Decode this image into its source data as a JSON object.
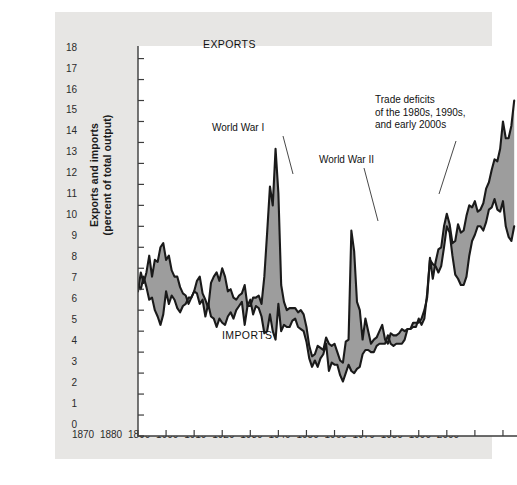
{
  "figure": {
    "background_color": "#e7e6e4",
    "plot_background_color": "#ffffff",
    "band_fill_color": "#9d9d9d",
    "line_color": "#1a1a1a"
  },
  "axis": {
    "y_title_line1": "Exports and imports",
    "y_title_line2": "(percent of total output)",
    "x_title": "Year",
    "y_ticks": [
      "0",
      "1",
      "2",
      "3",
      "4",
      "5",
      "6",
      "7",
      "8",
      "9",
      "10",
      "11",
      "12",
      "13",
      "14",
      "15",
      "16",
      "17",
      "18"
    ],
    "x_ticks": [
      "1870",
      "1880",
      "1890",
      "1900",
      "1910",
      "1920",
      "1930",
      "1940",
      "1950",
      "1960",
      "1970",
      "1980",
      "1990",
      "2000"
    ]
  },
  "labels": {
    "exports": "EXPORTS",
    "imports": "IMPORTS",
    "world_war_1": "World War I",
    "world_war_2": "World War II",
    "trade_deficits": "Trade deficits\nof the 1980s, 1990s,\nand early 2000s"
  },
  "chart_data": {
    "type": "area",
    "title": "",
    "subtitle": "",
    "xlabel": "Year",
    "ylabel": "Exports and imports (percent of total output)",
    "xlim": [
      1870,
      2005
    ],
    "ylim": [
      0,
      18.6
    ],
    "grid": false,
    "legend": "inline-labels",
    "annotations": [
      {
        "text": "World War I",
        "x": 1913,
        "y": 13.2
      },
      {
        "text": "World War II",
        "x": 1946,
        "y": 11.6
      },
      {
        "text": "Trade deficits of the 1980s, 1990s, and early 2000s",
        "x": 1977,
        "y": 15.2
      },
      {
        "text": "EXPORTS",
        "x": 1903,
        "y": 9.3
      },
      {
        "text": "IMPORTS",
        "x": 1906,
        "y": 4.8
      }
    ],
    "x": [
      1870,
      1871,
      1872,
      1873,
      1874,
      1875,
      1876,
      1877,
      1878,
      1879,
      1880,
      1881,
      1882,
      1883,
      1884,
      1885,
      1886,
      1887,
      1888,
      1889,
      1890,
      1891,
      1892,
      1893,
      1894,
      1895,
      1896,
      1897,
      1898,
      1899,
      1900,
      1901,
      1902,
      1903,
      1904,
      1905,
      1906,
      1907,
      1908,
      1909,
      1910,
      1911,
      1912,
      1913,
      1914,
      1915,
      1916,
      1917,
      1918,
      1919,
      1920,
      1921,
      1922,
      1923,
      1924,
      1925,
      1926,
      1927,
      1928,
      1929,
      1930,
      1931,
      1932,
      1933,
      1934,
      1935,
      1936,
      1937,
      1938,
      1939,
      1940,
      1941,
      1942,
      1943,
      1944,
      1945,
      1946,
      1947,
      1948,
      1949,
      1950,
      1951,
      1952,
      1953,
      1954,
      1955,
      1956,
      1957,
      1958,
      1959,
      1960,
      1961,
      1962,
      1963,
      1964,
      1965,
      1966,
      1967,
      1968,
      1969,
      1970,
      1971,
      1972,
      1973,
      1974,
      1975,
      1976,
      1977,
      1978,
      1979,
      1980,
      1981,
      1982,
      1983,
      1984,
      1985,
      1986,
      1987,
      1988,
      1989,
      1990,
      1991,
      1992,
      1993,
      1994,
      1995,
      1996,
      1997,
      1998,
      1999,
      2000,
      2001,
      2002,
      2003,
      2004
    ],
    "series": [
      {
        "name": "EXPORTS",
        "values": [
          6.9,
          7.8,
          7.3,
          7.8,
          8.6,
          7.6,
          8.4,
          8.3,
          9.0,
          9.2,
          8.4,
          8.6,
          7.9,
          7.6,
          7.6,
          7.1,
          6.8,
          6.7,
          6.3,
          6.6,
          6.9,
          7.4,
          7.6,
          6.8,
          6.5,
          6.1,
          7.3,
          7.6,
          7.8,
          7.4,
          8.0,
          7.6,
          6.9,
          7.0,
          6.6,
          6.5,
          6.7,
          6.8,
          7.2,
          6.2,
          6.2,
          6.6,
          6.6,
          6.7,
          6.3,
          7.6,
          9.7,
          11.9,
          11.0,
          13.7,
          11.6,
          7.2,
          6.4,
          6.0,
          6.1,
          6.1,
          6.1,
          5.9,
          6.0,
          5.8,
          5.2,
          4.3,
          3.8,
          3.9,
          4.3,
          4.2,
          4.1,
          4.7,
          4.4,
          4.3,
          4.4,
          4.0,
          3.6,
          3.5,
          4.5,
          4.6,
          9.8,
          8.8,
          6.4,
          6.0,
          4.6,
          5.6,
          5.0,
          4.4,
          4.6,
          4.7,
          5.0,
          5.3,
          4.6,
          4.4,
          4.9,
          4.8,
          4.8,
          4.9,
          5.1,
          5.0,
          5.1,
          5.1,
          5.2,
          5.2,
          5.6,
          5.3,
          5.6,
          6.8,
          8.4,
          8.2,
          8.1,
          7.8,
          8.1,
          9.0,
          10.0,
          9.7,
          8.6,
          7.7,
          7.5,
          7.2,
          7.2,
          7.6,
          8.6,
          9.3,
          9.6,
          10.0,
          10.0,
          9.8,
          10.2,
          10.8,
          10.9,
          11.3,
          10.8,
          10.7,
          11.2,
          10.0,
          9.5,
          9.3,
          10.0
        ]
      },
      {
        "name": "IMPORTS",
        "values": [
          7.2,
          7.0,
          7.6,
          7.1,
          6.5,
          6.6,
          6.0,
          5.7,
          5.3,
          5.8,
          6.9,
          6.3,
          6.7,
          6.5,
          6.1,
          5.9,
          6.2,
          6.3,
          6.6,
          6.6,
          6.9,
          6.8,
          6.3,
          6.5,
          5.7,
          6.3,
          5.7,
          5.6,
          5.2,
          5.6,
          5.4,
          5.3,
          5.7,
          5.9,
          5.6,
          6.0,
          6.2,
          6.4,
          5.3,
          6.2,
          6.5,
          5.8,
          6.2,
          6.1,
          5.7,
          4.9,
          5.0,
          5.8,
          5.0,
          4.6,
          6.3,
          5.0,
          5.3,
          5.2,
          5.2,
          5.5,
          5.6,
          5.2,
          5.1,
          5.0,
          4.5,
          3.7,
          3.3,
          3.6,
          3.3,
          3.7,
          3.9,
          4.4,
          3.1,
          3.5,
          3.4,
          3.4,
          2.9,
          2.6,
          3.0,
          3.4,
          3.1,
          3.0,
          3.2,
          3.3,
          3.9,
          4.1,
          4.1,
          4.0,
          4.0,
          4.3,
          4.4,
          4.4,
          4.4,
          4.8,
          4.4,
          4.3,
          4.4,
          4.4,
          4.4,
          4.6,
          5.1,
          5.1,
          5.4,
          5.4,
          5.4,
          5.6,
          6.0,
          6.6,
          8.5,
          7.5,
          8.3,
          8.9,
          9.0,
          10.0,
          10.6,
          10.1,
          9.2,
          9.3,
          10.1,
          9.7,
          9.8,
          10.5,
          11.0,
          10.9,
          11.2,
          10.7,
          10.8,
          11.1,
          11.8,
          12.1,
          12.7,
          13.2,
          13.1,
          13.7,
          15.0,
          14.2,
          14.2,
          14.8,
          16.0
        ]
      }
    ]
  }
}
